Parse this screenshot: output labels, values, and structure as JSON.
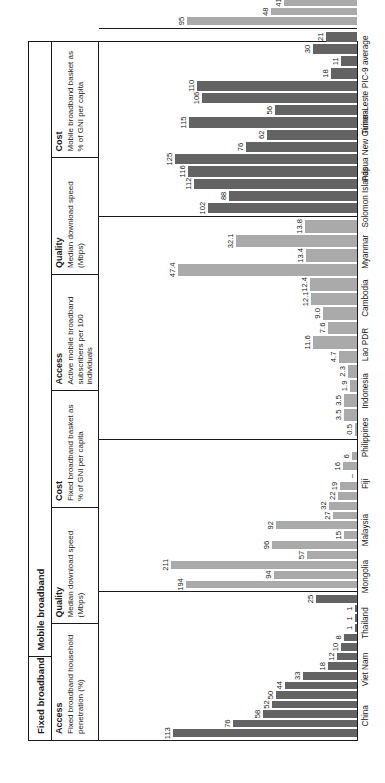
{
  "figure": {
    "orientation": "rotated-90-ccw",
    "colors": {
      "access_bar": "#636363",
      "quality_bar": "#aaaaaa",
      "cost_bar": "#aaaaaa",
      "border": "#1a1a1a",
      "background": "#ffffff"
    },
    "groups": [
      {
        "label": "Fixed broadband"
      },
      {
        "label": "Mobile broadband"
      }
    ],
    "panel_headers": [
      {
        "title": "Access",
        "desc": "Fixed broadband household penetration (%)"
      },
      {
        "title": "Quality",
        "desc": "Median download speed (Mbps)"
      },
      {
        "title": "Cost",
        "desc": "Fixed broadband basket as % of GNI per capita"
      },
      {
        "title": "Access",
        "desc": "Active mobile broadband subscribers per 100 individuals"
      },
      {
        "title": "Quality",
        "desc": "Median download speed (Mbps)"
      },
      {
        "title": "Cost",
        "desc": "Mobile broadband basket as % of GNI per capita"
      }
    ]
  },
  "chart_data": {
    "type": "bar",
    "title": "",
    "categories": [
      "China",
      "Viet Nam",
      "Thailand",
      "Mongolia",
      "Malaysia",
      "Fiji",
      "Philippines",
      "Indonesia",
      "Lao PDR",
      "Cambodia",
      "Myanmar",
      "Solomon Islands",
      "Papua New Guinea",
      "Timor-Leste",
      "PIC-9 average"
    ],
    "panels": [
      {
        "group": "Fixed broadband",
        "metric": "Access",
        "ylabel": "Fixed broadband household penetration (%)",
        "values": [
          113,
          76,
          58,
          52,
          50,
          44,
          33,
          18,
          12,
          10,
          8,
          1,
          1,
          1,
          25
        ],
        "labels": [
          "113",
          "76",
          "58",
          "52",
          "50",
          "44",
          "33",
          "18",
          "12",
          "10",
          "8",
          "1",
          "1",
          "1",
          "25"
        ],
        "ymax": 130,
        "color": "#636363"
      },
      {
        "group": "Fixed broadband",
        "metric": "Quality",
        "ylabel": "Median download speed (Mbps)",
        "values": [
          194,
          94,
          211,
          57,
          96,
          15,
          92,
          27,
          32,
          22,
          19,
          null,
          16,
          6,
          null
        ],
        "labels": [
          "194",
          "94",
          "211",
          "57",
          "96",
          "15",
          "92",
          "27",
          "32",
          "22",
          "19",
          "–",
          "16",
          "6",
          ""
        ],
        "ymax": 240,
        "color": "#aaaaaa"
      },
      {
        "group": "Fixed broadband",
        "metric": "Cost",
        "ylabel": "Fixed broadband basket as % of GNI per capita",
        "values": [
          0.5,
          3.5,
          3.5,
          1.9,
          2.3,
          4.7,
          11.6,
          7.6,
          9.0,
          12.1,
          12.4,
          47.4,
          13.4,
          32.1,
          13.8
        ],
        "labels": [
          "0.5",
          "3.5",
          "3.5",
          "1.9",
          "2.3",
          "4.7",
          "11.6",
          "7.6",
          "9.0",
          "12.1",
          "12.4",
          "47.4",
          "13.4",
          "32.1",
          "13.8"
        ],
        "ymax": 56,
        "color": "#aaaaaa"
      },
      {
        "group": "Mobile broadband",
        "metric": "Access",
        "ylabel": "Active mobile broadband subscribers per 100 individuals",
        "values": [
          102,
          88,
          112,
          116,
          125,
          76,
          62,
          115,
          56,
          106,
          110,
          18,
          11,
          30,
          21
        ],
        "labels": [
          "102",
          "88",
          "112",
          "116",
          "125",
          "76",
          "62",
          "115",
          "56",
          "106",
          "110",
          "18",
          "11",
          "30",
          "21"
        ],
        "ymax": 145,
        "color": "#636363"
      },
      {
        "group": "Mobile broadband",
        "metric": "Quality",
        "ylabel": "Median download speed (Mbps)",
        "values": [
          95,
          48,
          41,
          15,
          49,
          22,
          26,
          24,
          30,
          24,
          23,
          null,
          20,
          null,
          null
        ],
        "labels": [
          "95",
          "48",
          "41",
          "15",
          "49",
          "22",
          "26",
          "24",
          "30",
          "24",
          "23",
          "–",
          "20",
          "–",
          ""
        ],
        "ymax": 118,
        "color": "#aaaaaa"
      },
      {
        "group": "Mobile broadband",
        "metric": "Cost",
        "ylabel": "Mobile broadband basket as % of GNI per capita",
        "values": [
          0.5,
          0.5,
          1.4,
          1.9,
          1.0,
          3.0,
          2.0,
          0.9,
          2.7,
          2.4,
          1.7,
          8.9,
          18.8,
          4.6,
          4.4
        ],
        "labels": [
          "0.5",
          "0.5",
          "1.4",
          "1.9",
          "1.0",
          "3.0",
          "2.0",
          "0.9",
          "2.7",
          "2.4",
          "1.7",
          "8.9",
          "18.8",
          "4.6",
          "4.4"
        ],
        "ymax": 23,
        "color": "#aaaaaa"
      }
    ],
    "xlabel": "",
    "ylabel": "",
    "grid": false,
    "legend": "none"
  }
}
